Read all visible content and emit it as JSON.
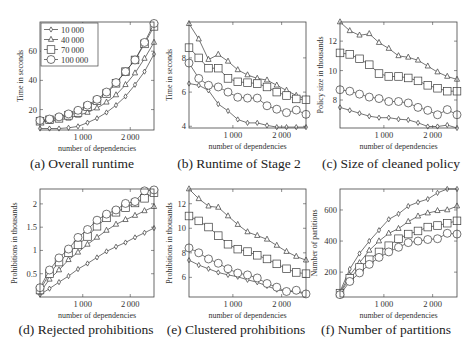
{
  "figure": {
    "width": 473,
    "height": 356,
    "line_color": "#3a3a3a"
  },
  "legend": {
    "entries": [
      {
        "label": "10 000",
        "marker": "diamond"
      },
      {
        "label": "40 000",
        "marker": "triangle"
      },
      {
        "label": "70 000",
        "marker": "square"
      },
      {
        "label": "100 000",
        "marker": "circle"
      }
    ]
  },
  "chart_data": [
    {
      "id": "a",
      "type": "line",
      "title": "(a) Overall runtime",
      "xlabel": "number of dependencies",
      "ylabel": "Time in seconds",
      "xlim": [
        100,
        2500
      ],
      "ylim": [
        6,
        80
      ],
      "xticks": [
        {
          "v": 1000,
          "label": "1 000"
        },
        {
          "v": 2000,
          "label": "2 000"
        }
      ],
      "yticks": [
        {
          "v": 20,
          "label": "20"
        },
        {
          "v": 40,
          "label": "40"
        },
        {
          "v": 60,
          "label": "60"
        }
      ],
      "grid": false,
      "legend_position": "upper left",
      "box": {
        "x": 40,
        "y": 22,
        "w": 114,
        "h": 108
      },
      "x": [
        100,
        300,
        500,
        700,
        900,
        1100,
        1300,
        1500,
        1700,
        1900,
        2100,
        2300,
        2500
      ],
      "series": [
        {
          "name": "10 000",
          "marker": "diamond",
          "values": [
            7,
            7,
            7,
            7.5,
            8.5,
            11,
            14,
            18,
            23,
            29,
            37,
            46,
            58
          ]
        },
        {
          "name": "40 000",
          "marker": "triangle",
          "values": [
            11.5,
            12,
            13,
            14,
            16,
            18,
            21,
            25,
            30,
            37,
            45,
            55,
            66
          ]
        },
        {
          "name": "70 000",
          "marker": "square",
          "values": [
            12,
            13,
            14,
            16,
            18,
            22,
            26,
            31,
            38,
            46,
            54,
            65,
            77
          ]
        },
        {
          "name": "100 000",
          "marker": "circle",
          "values": [
            12.5,
            13.5,
            15,
            17,
            19.5,
            23,
            27,
            32,
            38.5,
            46,
            54,
            66,
            79
          ]
        }
      ]
    },
    {
      "id": "b",
      "type": "line",
      "title": "(b) Runtime of Stage 2",
      "xlabel": "number of dependencies",
      "ylabel": "Time in seconds",
      "xlim": [
        100,
        2500
      ],
      "ylim": [
        3.9,
        10.1
      ],
      "xticks": [
        {
          "v": 1000,
          "label": "1 000"
        },
        {
          "v": 2000,
          "label": "2 000"
        }
      ],
      "yticks": [
        {
          "v": 4,
          "label": "4"
        },
        {
          "v": 6,
          "label": "6"
        },
        {
          "v": 8,
          "label": "8"
        }
      ],
      "grid": false,
      "box": {
        "x": 189,
        "y": 22,
        "w": 117,
        "h": 106
      },
      "x": [
        100,
        300,
        500,
        700,
        900,
        1100,
        1300,
        1500,
        1700,
        1900,
        2100,
        2300,
        2500
      ],
      "series": [
        {
          "name": "10 000",
          "marker": "diamond",
          "values": [
            6.5,
            6.4,
            6.1,
            5.3,
            4.9,
            4.4,
            4.2,
            4.2,
            4.05,
            3.95,
            3.95,
            3.95,
            3.95
          ]
        },
        {
          "name": "40 000",
          "marker": "triangle",
          "values": [
            10,
            9.1,
            7.9,
            8.2,
            7.8,
            7.3,
            7.0,
            6.8,
            6.7,
            6.4,
            6.1,
            5.8,
            5.6
          ]
        },
        {
          "name": "70 000",
          "marker": "square",
          "values": [
            8.6,
            8.0,
            7.4,
            7.4,
            6.8,
            6.6,
            6.55,
            6.5,
            6.3,
            6.0,
            5.8,
            5.6,
            5.55
          ]
        },
        {
          "name": "100 000",
          "marker": "circle",
          "values": [
            7.7,
            6.8,
            6.4,
            6.3,
            6.0,
            5.7,
            5.65,
            5.65,
            5.2,
            5.0,
            4.8,
            4.95,
            4.7
          ]
        }
      ]
    },
    {
      "id": "c",
      "type": "line",
      "title": "(c) Size of cleaned policy",
      "xlabel": "number of dependencies",
      "ylabel": "Policy size in thousands",
      "xlim": [
        100,
        2500
      ],
      "ylim": [
        6.1,
        13.3
      ],
      "xticks": [
        {
          "v": 1000,
          "label": "1 000"
        },
        {
          "v": 2000,
          "label": "2 000"
        }
      ],
      "yticks": [
        {
          "v": 8,
          "label": "8"
        },
        {
          "v": 10,
          "label": "10"
        },
        {
          "v": 12,
          "label": "12"
        }
      ],
      "grid": false,
      "box": {
        "x": 340,
        "y": 22,
        "w": 117,
        "h": 106
      },
      "x": [
        100,
        300,
        500,
        700,
        900,
        1100,
        1300,
        1500,
        1700,
        1900,
        2100,
        2300,
        2500
      ],
      "series": [
        {
          "name": "10 000",
          "marker": "diamond",
          "values": [
            7.5,
            7.3,
            7.1,
            6.9,
            6.8,
            6.8,
            6.7,
            6.65,
            6.45,
            6.2,
            6.2,
            6.3,
            6.1
          ]
        },
        {
          "name": "40 000",
          "marker": "triangle",
          "values": [
            13.3,
            12.7,
            12.4,
            12.5,
            11.9,
            11.5,
            11.0,
            10.9,
            10.7,
            10.3,
            9.9,
            9.6,
            9.4
          ]
        },
        {
          "name": "70 000",
          "marker": "square",
          "values": [
            11.2,
            11.1,
            10.8,
            10.4,
            9.8,
            9.6,
            9.6,
            9.5,
            9.3,
            9.0,
            8.8,
            8.6,
            8.6
          ]
        },
        {
          "name": "100 000",
          "marker": "circle",
          "values": [
            8.7,
            8.6,
            8.4,
            8.2,
            8.1,
            7.9,
            7.9,
            7.8,
            7.5,
            7.3,
            7.0,
            7.35,
            7.0
          ]
        }
      ]
    },
    {
      "id": "d",
      "type": "line",
      "title": "(d) Rejected prohibitions",
      "xlabel": "number of dependencies",
      "ylabel": "Prohibitions in thousands",
      "xlim": [
        100,
        2500
      ],
      "ylim": [
        0.0,
        2.32
      ],
      "xticks": [
        {
          "v": 1000,
          "label": "1 000"
        },
        {
          "v": 2000,
          "label": "2 000"
        }
      ],
      "yticks": [
        {
          "v": 0.5,
          "label": "0.5"
        },
        {
          "v": 1,
          "label": "1"
        },
        {
          "v": 1.5,
          "label": "1.5"
        },
        {
          "v": 2,
          "label": "2"
        }
      ],
      "grid": false,
      "box": {
        "x": 40,
        "y": 189,
        "w": 114,
        "h": 108
      },
      "x": [
        100,
        300,
        500,
        700,
        900,
        1100,
        1300,
        1500,
        1700,
        1900,
        2100,
        2300,
        2500
      ],
      "series": [
        {
          "name": "10 000",
          "marker": "diamond",
          "values": [
            0.05,
            0.18,
            0.32,
            0.45,
            0.6,
            0.72,
            0.85,
            0.98,
            1.08,
            1.17,
            1.28,
            1.38,
            1.48
          ]
        },
        {
          "name": "40 000",
          "marker": "triangle",
          "values": [
            0.1,
            0.38,
            0.58,
            0.8,
            0.96,
            1.13,
            1.28,
            1.43,
            1.56,
            1.66,
            1.75,
            1.85,
            1.94
          ]
        },
        {
          "name": "70 000",
          "marker": "square",
          "values": [
            0.15,
            0.5,
            0.75,
            0.95,
            1.12,
            1.3,
            1.52,
            1.7,
            1.82,
            1.92,
            2.02,
            2.12,
            2.24
          ]
        },
        {
          "name": "100 000",
          "marker": "circle",
          "values": [
            0.2,
            0.58,
            0.84,
            1.03,
            1.28,
            1.45,
            1.65,
            1.78,
            1.87,
            2.01,
            2.05,
            2.28,
            2.3
          ]
        }
      ]
    },
    {
      "id": "e",
      "type": "line",
      "title": "(e) Clustered prohibitions",
      "xlabel": "number of dependencies",
      "ylabel": "Prohibitions in thousands",
      "xlim": [
        100,
        2500
      ],
      "ylim": [
        4.4,
        13.2
      ],
      "xticks": [
        {
          "v": 1000,
          "label": "1 000"
        },
        {
          "v": 2000,
          "label": "2 000"
        }
      ],
      "yticks": [
        {
          "v": 6,
          "label": "6"
        },
        {
          "v": 8,
          "label": "8"
        },
        {
          "v": 10,
          "label": "10"
        },
        {
          "v": 12,
          "label": "12"
        }
      ],
      "grid": false,
      "box": {
        "x": 189,
        "y": 189,
        "w": 117,
        "h": 108
      },
      "x": [
        100,
        300,
        500,
        700,
        900,
        1100,
        1300,
        1500,
        1700,
        1900,
        2100,
        2300,
        2500
      ],
      "series": [
        {
          "name": "10 000",
          "marker": "diamond",
          "values": [
            7.4,
            7.0,
            6.7,
            6.4,
            6.2,
            6.05,
            5.8,
            5.6,
            5.3,
            5.0,
            4.85,
            4.85,
            4.6
          ]
        },
        {
          "name": "40 000",
          "marker": "triangle",
          "values": [
            13.2,
            12.4,
            11.8,
            11.7,
            11.0,
            10.3,
            9.7,
            9.4,
            9.1,
            8.6,
            8.1,
            7.7,
            7.4
          ]
        },
        {
          "name": "70 000",
          "marker": "square",
          "values": [
            11.0,
            10.6,
            10.1,
            9.4,
            8.7,
            8.3,
            8.1,
            7.8,
            7.5,
            7.1,
            6.7,
            6.4,
            6.3
          ]
        },
        {
          "name": "100 000",
          "marker": "circle",
          "values": [
            8.4,
            8.0,
            7.5,
            7.15,
            6.7,
            6.35,
            6.2,
            5.95,
            5.5,
            5.2,
            4.85,
            4.95,
            4.65
          ]
        }
      ]
    },
    {
      "id": "f",
      "type": "line",
      "title": "(f) Number of partitions",
      "xlabel": "number of dependencies",
      "ylabel": "Number of partitions",
      "xlim": [
        100,
        2500
      ],
      "ylim": [
        40,
        735
      ],
      "xticks": [
        {
          "v": 1000,
          "label": "1 000"
        },
        {
          "v": 2000,
          "label": "2 000"
        }
      ],
      "yticks": [
        {
          "v": 200,
          "label": "200"
        },
        {
          "v": 400,
          "label": "400"
        },
        {
          "v": 600,
          "label": "600"
        }
      ],
      "grid": false,
      "box": {
        "x": 340,
        "y": 189,
        "w": 117,
        "h": 108
      },
      "x": [
        100,
        300,
        500,
        700,
        900,
        1100,
        1300,
        1500,
        1700,
        1900,
        2100,
        2300,
        2500
      ],
      "series": [
        {
          "name": "10 000",
          "marker": "diamond",
          "values": [
            75,
            220,
            320,
            400,
            470,
            540,
            575,
            625,
            650,
            670,
            710,
            735,
            735
          ]
        },
        {
          "name": "40 000",
          "marker": "triangle",
          "values": [
            70,
            180,
            260,
            340,
            400,
            450,
            480,
            525,
            560,
            580,
            595,
            600,
            625
          ]
        },
        {
          "name": "70 000",
          "marker": "square",
          "values": [
            65,
            160,
            230,
            280,
            330,
            370,
            415,
            445,
            465,
            490,
            500,
            515,
            530
          ]
        },
        {
          "name": "100 000",
          "marker": "circle",
          "values": [
            55,
            140,
            195,
            250,
            295,
            330,
            360,
            390,
            400,
            410,
            415,
            450,
            445
          ]
        }
      ]
    }
  ]
}
